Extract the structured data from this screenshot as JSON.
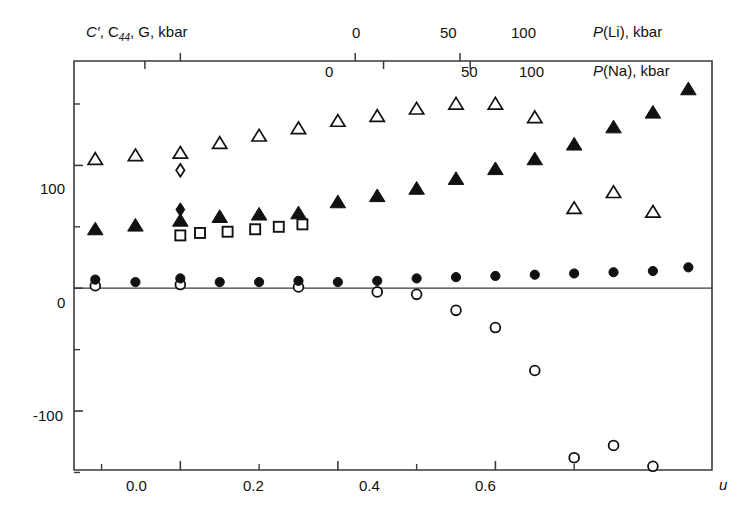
{
  "chart_data": {
    "type": "scatter",
    "title": "",
    "xlabel": "u",
    "ylabel": "C', C44, G, kbar",
    "xlim": [
      -0.135,
      0.675
    ],
    "ylim": [
      -148,
      185
    ],
    "grid": false,
    "legend": "none",
    "axes": {
      "left": {
        "label": "C', C44, G, kbar",
        "ticks": [
          -100,
          0,
          100
        ],
        "tick_labels": [
          "-100",
          "0",
          "100"
        ],
        "minor_ticks": [
          -150,
          -50,
          50,
          150
        ]
      },
      "bottom": {
        "label": "u",
        "ticks": [
          0.0,
          0.2,
          0.4,
          0.6
        ],
        "tick_labels": [
          "0.0",
          "0.2",
          "0.4",
          "0.6"
        ],
        "minor_ticks": [
          -0.1,
          0.1,
          0.3,
          0.5
        ]
      },
      "top_li": {
        "label": "P(Li), kbar",
        "ticks": [
          0,
          50,
          100
        ],
        "tick_labels": [
          "0",
          "50",
          "100"
        ],
        "tick_u_positions": [
          0.0,
          0.222,
          0.355
        ]
      },
      "top_na": {
        "label": "P(Na), kbar",
        "ticks": [
          0,
          50,
          100
        ],
        "tick_labels": [
          "0",
          "50",
          "100"
        ],
        "tick_u_positions": [
          -0.045,
          0.258,
          0.368
        ]
      }
    },
    "series": [
      {
        "name": "open-triangle",
        "marker": "triangle-open",
        "color": "#111111",
        "points": [
          {
            "x": -0.108,
            "y": 105
          },
          {
            "x": -0.057,
            "y": 108
          },
          {
            "x": 0.0,
            "y": 110
          },
          {
            "x": 0.05,
            "y": 118
          },
          {
            "x": 0.1,
            "y": 124
          },
          {
            "x": 0.15,
            "y": 130
          },
          {
            "x": 0.2,
            "y": 136
          },
          {
            "x": 0.25,
            "y": 140
          },
          {
            "x": 0.3,
            "y": 146
          },
          {
            "x": 0.35,
            "y": 150
          },
          {
            "x": 0.4,
            "y": 150
          },
          {
            "x": 0.45,
            "y": 139
          },
          {
            "x": 0.5,
            "y": 65
          },
          {
            "x": 0.55,
            "y": 78
          },
          {
            "x": 0.6,
            "y": 62
          }
        ]
      },
      {
        "name": "filled-triangle",
        "marker": "triangle-filled",
        "color": "#111111",
        "points": [
          {
            "x": -0.108,
            "y": 48
          },
          {
            "x": -0.057,
            "y": 51
          },
          {
            "x": 0.0,
            "y": 55
          },
          {
            "x": 0.05,
            "y": 58
          },
          {
            "x": 0.1,
            "y": 60
          },
          {
            "x": 0.15,
            "y": 61
          },
          {
            "x": 0.2,
            "y": 70
          },
          {
            "x": 0.25,
            "y": 75
          },
          {
            "x": 0.3,
            "y": 81
          },
          {
            "x": 0.35,
            "y": 89
          },
          {
            "x": 0.4,
            "y": 97
          },
          {
            "x": 0.45,
            "y": 105
          },
          {
            "x": 0.5,
            "y": 117
          },
          {
            "x": 0.55,
            "y": 131
          },
          {
            "x": 0.6,
            "y": 143
          },
          {
            "x": 0.645,
            "y": 162
          }
        ]
      },
      {
        "name": "open-square",
        "marker": "square-open",
        "color": "#111111",
        "points": [
          {
            "x": 0.0,
            "y": 43
          },
          {
            "x": 0.025,
            "y": 45
          },
          {
            "x": 0.06,
            "y": 46
          },
          {
            "x": 0.095,
            "y": 48
          },
          {
            "x": 0.125,
            "y": 50
          },
          {
            "x": 0.155,
            "y": 52
          }
        ]
      },
      {
        "name": "open-diamond",
        "marker": "diamond-open",
        "color": "#111111",
        "points": [
          {
            "x": 0.0,
            "y": 96
          }
        ]
      },
      {
        "name": "filled-diamond",
        "marker": "diamond-filled",
        "color": "#111111",
        "points": [
          {
            "x": 0.0,
            "y": 64
          }
        ]
      },
      {
        "name": "filled-circle",
        "marker": "circle-filled",
        "color": "#111111",
        "points": [
          {
            "x": -0.108,
            "y": 7
          },
          {
            "x": -0.057,
            "y": 5
          },
          {
            "x": 0.0,
            "y": 8
          },
          {
            "x": 0.05,
            "y": 5
          },
          {
            "x": 0.1,
            "y": 5
          },
          {
            "x": 0.15,
            "y": 6
          },
          {
            "x": 0.2,
            "y": 5
          },
          {
            "x": 0.25,
            "y": 6
          },
          {
            "x": 0.3,
            "y": 8
          },
          {
            "x": 0.35,
            "y": 9
          },
          {
            "x": 0.4,
            "y": 10
          },
          {
            "x": 0.45,
            "y": 11
          },
          {
            "x": 0.5,
            "y": 12
          },
          {
            "x": 0.55,
            "y": 13
          },
          {
            "x": 0.6,
            "y": 14
          },
          {
            "x": 0.645,
            "y": 17
          }
        ]
      },
      {
        "name": "open-circle",
        "marker": "circle-open",
        "color": "#111111",
        "points": [
          {
            "x": -0.108,
            "y": 2
          },
          {
            "x": 0.0,
            "y": 3
          },
          {
            "x": 0.15,
            "y": 1
          },
          {
            "x": 0.25,
            "y": -3
          },
          {
            "x": 0.3,
            "y": -5
          },
          {
            "x": 0.35,
            "y": -18
          },
          {
            "x": 0.4,
            "y": -32
          },
          {
            "x": 0.45,
            "y": -67
          },
          {
            "x": 0.5,
            "y": -138
          },
          {
            "x": 0.55,
            "y": -128
          },
          {
            "x": 0.6,
            "y": -145
          }
        ]
      }
    ]
  },
  "labels": {
    "y_axis_title_part1": "C",
    "y_axis_title_prime": "′",
    "y_axis_title_part2": ", C",
    "y_axis_title_sub": "44",
    "y_axis_title_part3": ", G, kbar",
    "p_li_italic": "P",
    "p_li_rest": "(Li), kbar",
    "p_na_italic": "P",
    "p_na_rest": "(Na), kbar",
    "x_axis_title": "u",
    "y_tick_100": "100",
    "y_tick_0": "0",
    "y_tick_neg100": "-100",
    "x_tick_00": "0.0",
    "x_tick_02": "0.2",
    "x_tick_04": "0.4",
    "x_tick_06": "0.6",
    "li_tick_0": "0",
    "li_tick_50": "50",
    "li_tick_100": "100",
    "na_tick_0": "0",
    "na_tick_50": "50",
    "na_tick_100": "100"
  },
  "colors": {
    "ink": "#111111",
    "axis": "#3a3a3a",
    "background": "#ffffff"
  }
}
